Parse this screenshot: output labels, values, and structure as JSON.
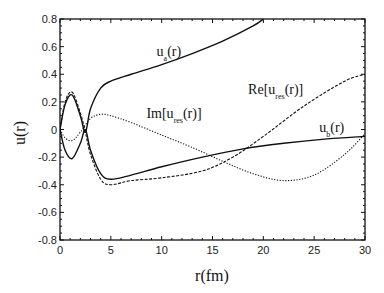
{
  "chart_data": {
    "type": "line",
    "title": "",
    "xlabel": "r(fm)",
    "ylabel": "u(r)",
    "xlim": [
      0,
      30
    ],
    "ylim": [
      -0.8,
      0.8
    ],
    "xticks": [
      "0",
      "5",
      "10",
      "15",
      "20",
      "25",
      "30"
    ],
    "yticks": [
      "0.8",
      "0.6",
      "0.4",
      "0.2",
      "0",
      "-0.2",
      "-0.4",
      "-0.6",
      "-0.8"
    ],
    "grid": false,
    "legend": "inline annotations",
    "series": [
      {
        "name": "u_a(r)",
        "style": "solid",
        "x": [
          0,
          0.5,
          1.2,
          2,
          2.5,
          3,
          4,
          5,
          7,
          10,
          13,
          16,
          19,
          20
        ],
        "y": [
          0,
          0.18,
          0.25,
          0.1,
          -0.02,
          0.15,
          0.3,
          0.35,
          0.4,
          0.47,
          0.55,
          0.64,
          0.75,
          0.8
        ]
      },
      {
        "name": "u_b(r)",
        "style": "solid",
        "x": [
          0,
          0.5,
          1.2,
          2,
          2.5,
          3,
          4,
          5,
          7,
          10,
          14,
          18,
          22,
          26,
          30
        ],
        "y": [
          0,
          -0.15,
          -0.21,
          -0.1,
          0.0,
          -0.15,
          -0.32,
          -0.36,
          -0.33,
          -0.27,
          -0.2,
          -0.14,
          -0.1,
          -0.07,
          -0.05
        ]
      },
      {
        "name": "Re[u_res(r)]",
        "style": "dashed",
        "x": [
          0,
          0.5,
          1.2,
          2,
          2.5,
          3,
          4,
          5,
          7,
          10,
          14,
          17,
          20,
          24,
          28,
          30
        ],
        "y": [
          0,
          0.2,
          0.27,
          0.12,
          -0.02,
          -0.18,
          -0.36,
          -0.4,
          -0.37,
          -0.35,
          -0.3,
          -0.2,
          -0.05,
          0.17,
          0.35,
          0.4
        ]
      },
      {
        "name": "Im[u_res(r)]",
        "style": "dotted",
        "x": [
          0,
          0.5,
          1.2,
          2,
          3,
          4,
          5,
          7,
          10,
          13,
          16,
          19,
          22,
          25,
          28,
          30
        ],
        "y": [
          0,
          -0.06,
          -0.08,
          -0.02,
          0.08,
          0.11,
          0.1,
          0.05,
          -0.04,
          -0.13,
          -0.23,
          -0.32,
          -0.37,
          -0.33,
          -0.18,
          -0.03
        ]
      }
    ],
    "annotations": [
      {
        "text": "u",
        "sub": "a",
        "suffix": "(r)",
        "x": 9.5,
        "y": 0.53
      },
      {
        "text": "Im[u",
        "sub": "res",
        "suffix": "(r)]",
        "x": 8.5,
        "y": 0.08
      },
      {
        "text": "Re[u",
        "sub": "res",
        "suffix": "(r)]",
        "x": 18.5,
        "y": 0.26
      },
      {
        "text": "u",
        "sub": "b",
        "suffix": "(r)",
        "x": 25.5,
        "y": -0.02
      }
    ]
  }
}
